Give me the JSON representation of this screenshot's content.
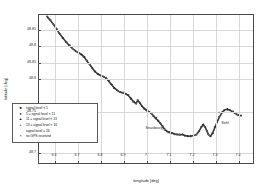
{
  "chart_data": {
    "type": "scatter",
    "title": "",
    "subtitle": "",
    "xlabel": "longitude [deg]",
    "ylabel": "latitude [deg]",
    "xlim": [
      6.53,
      7.47
    ],
    "ylim": [
      48.685,
      48.868
    ],
    "grid": true,
    "legend_position": "lower-left inside axes",
    "xticks": [
      "6.6",
      "6.7",
      "6.8",
      "6.9",
      "7",
      "7.1",
      "7.2",
      "7.3",
      "7.4"
    ],
    "xtick_values": [
      6.6,
      6.7,
      6.8,
      6.9,
      7.0,
      7.1,
      7.2,
      7.3,
      7.4
    ],
    "yticks": [
      "48.85",
      "48.8",
      "48.85",
      "48.8",
      "48.75",
      "48.7"
    ],
    "ytick_labels": [
      "48.85",
      "48.8",
      "48.85",
      "48.8",
      "48.75",
      "48.7"
    ],
    "ytick_values": [
      48.85,
      48.83,
      48.81,
      48.79,
      48.75,
      48.7
    ],
    "series": [
      {
        "name": "signal level < 5",
        "marker": "square",
        "glyph": "■",
        "color": "#2a2a2a"
      },
      {
        "name": "5 ≤ signal level < 11",
        "marker": "circle",
        "glyph": "●",
        "color": "#3a3a3a"
      },
      {
        "name": "11 ≤ signal level < 13",
        "marker": "triangle",
        "glyph": "▲",
        "color": "#4a4a4a"
      },
      {
        "name": "13 ≤ signal level < 16",
        "marker": "plus",
        "glyph": "+",
        "color": "#5a5a5a"
      },
      {
        "name": "signal level ≥ 16",
        "marker": "dot",
        "glyph": "·",
        "color": "#6a6a6a"
      },
      {
        "name": "no GPS received",
        "marker": "cross",
        "glyph": "×",
        "color": "#2a2a2a"
      }
    ],
    "track_points": [
      [
        6.565,
        48.866
      ],
      [
        6.578,
        48.862
      ],
      [
        6.592,
        48.857
      ],
      [
        6.606,
        48.851
      ],
      [
        6.62,
        48.845
      ],
      [
        6.634,
        48.84
      ],
      [
        6.648,
        48.835
      ],
      [
        6.662,
        48.831
      ],
      [
        6.676,
        48.827
      ],
      [
        6.69,
        48.824
      ],
      [
        6.702,
        48.822
      ],
      [
        6.714,
        48.82
      ],
      [
        6.726,
        48.817
      ],
      [
        6.738,
        48.812
      ],
      [
        6.75,
        48.808
      ],
      [
        6.762,
        48.803
      ],
      [
        6.774,
        48.799
      ],
      [
        6.786,
        48.796
      ],
      [
        6.798,
        48.794
      ],
      [
        6.81,
        48.793
      ],
      [
        6.822,
        48.791
      ],
      [
        6.834,
        48.787
      ],
      [
        6.846,
        48.783
      ],
      [
        6.858,
        48.779
      ],
      [
        6.87,
        48.776
      ],
      [
        6.882,
        48.774
      ],
      [
        6.894,
        48.773
      ],
      [
        6.906,
        48.772
      ],
      [
        6.918,
        48.77
      ],
      [
        6.93,
        48.766
      ],
      [
        6.942,
        48.762
      ],
      [
        6.952,
        48.76
      ],
      [
        6.96,
        48.764
      ],
      [
        6.968,
        48.761
      ],
      [
        6.978,
        48.757
      ],
      [
        6.988,
        48.754
      ],
      [
        6.998,
        48.752
      ],
      [
        7.008,
        48.75
      ],
      [
        7.018,
        48.748
      ],
      [
        7.028,
        48.745
      ],
      [
        7.038,
        48.742
      ],
      [
        7.048,
        48.739
      ],
      [
        7.058,
        48.736
      ],
      [
        7.068,
        48.732
      ],
      [
        7.078,
        48.728
      ],
      [
        7.088,
        48.726
      ],
      [
        7.098,
        48.725
      ],
      [
        7.108,
        48.724
      ],
      [
        7.118,
        48.723
      ],
      [
        7.13,
        48.722
      ],
      [
        7.142,
        48.722
      ],
      [
        7.154,
        48.722
      ],
      [
        7.166,
        48.721
      ],
      [
        7.178,
        48.72
      ],
      [
        7.19,
        48.72
      ],
      [
        7.202,
        48.721
      ],
      [
        7.214,
        48.722
      ],
      [
        7.226,
        48.726
      ],
      [
        7.236,
        48.731
      ],
      [
        7.244,
        48.734
      ],
      [
        7.252,
        48.732
      ],
      [
        7.26,
        48.727
      ],
      [
        7.268,
        48.722
      ],
      [
        7.276,
        48.72
      ],
      [
        7.286,
        48.724
      ],
      [
        7.296,
        48.731
      ],
      [
        7.306,
        48.738
      ],
      [
        7.316,
        48.744
      ],
      [
        7.326,
        48.749
      ],
      [
        7.336,
        48.752
      ],
      [
        7.348,
        48.753
      ],
      [
        7.36,
        48.752
      ],
      [
        7.372,
        48.75
      ],
      [
        7.384,
        48.748
      ],
      [
        7.396,
        48.746
      ],
      [
        7.408,
        48.745
      ]
    ],
    "annotations": [
      {
        "label": "Strasbourg",
        "x": 7.035,
        "y": 48.729,
        "marker": "○",
        "marker_x": 7.048,
        "marker_y": 48.742
      },
      {
        "label": "Kehl",
        "x": 7.345,
        "y": 48.735,
        "marker": "+",
        "marker_x": 7.318,
        "marker_y": 48.748
      }
    ]
  }
}
